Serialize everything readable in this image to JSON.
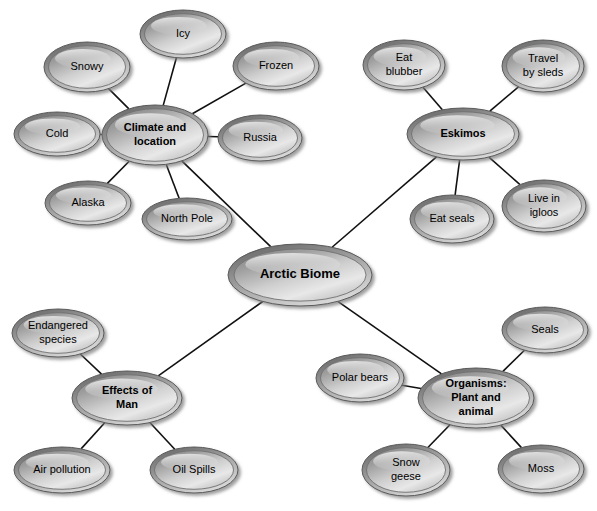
{
  "diagram": {
    "type": "mind-map",
    "background_color": "#ffffff",
    "edge_color": "#111111",
    "node_fill_light": "#e9e9e9",
    "node_fill_mid": "#a9a9a9",
    "node_fill_dark": "#6e6e6e",
    "node_text_color": "#000000"
  },
  "center": {
    "id": "arctic-biome",
    "label": "Arctic Biome",
    "cx": 300,
    "cy": 275,
    "rx": 72,
    "ry": 31,
    "font_size": 13,
    "level": "center"
  },
  "hubs": [
    {
      "id": "climate-and-location",
      "label": "Climate and location",
      "lines": [
        "Climate and",
        "location"
      ],
      "cx": 155,
      "cy": 135,
      "rx": 53,
      "ry": 30,
      "font_size": 11,
      "level": "hub"
    },
    {
      "id": "eskimos",
      "label": "Eskimos",
      "lines": [
        "Eskimos"
      ],
      "cx": 463,
      "cy": 134,
      "rx": 56,
      "ry": 26,
      "font_size": 11,
      "level": "hub"
    },
    {
      "id": "effects-of-man",
      "label": "Effects of Man",
      "lines": [
        "Effects of",
        "Man"
      ],
      "cx": 127,
      "cy": 398,
      "rx": 55,
      "ry": 27,
      "font_size": 11,
      "level": "hub"
    },
    {
      "id": "organisms-plant-and-animal",
      "label": "Organisms: Plant and animal",
      "lines": [
        "Organisms:",
        "Plant and",
        "animal"
      ],
      "cx": 476,
      "cy": 398,
      "rx": 58,
      "ry": 30,
      "font_size": 11,
      "level": "hub"
    }
  ],
  "leaves": [
    {
      "id": "icy",
      "parent": "climate-and-location",
      "label": "Icy",
      "lines": [
        "Icy"
      ],
      "cx": 183,
      "cy": 34,
      "rx": 43,
      "ry": 24,
      "font_size": 11,
      "level": "leaf"
    },
    {
      "id": "snowy",
      "parent": "climate-and-location",
      "label": "Snowy",
      "lines": [
        "Snowy"
      ],
      "cx": 87,
      "cy": 67,
      "rx": 43,
      "ry": 25,
      "font_size": 11,
      "level": "leaf"
    },
    {
      "id": "frozen",
      "parent": "climate-and-location",
      "label": "Frozen",
      "lines": [
        "Frozen"
      ],
      "cx": 276,
      "cy": 66,
      "rx": 43,
      "ry": 24,
      "font_size": 11,
      "level": "leaf"
    },
    {
      "id": "cold",
      "parent": "climate-and-location",
      "label": "Cold",
      "lines": [
        "Cold"
      ],
      "cx": 57,
      "cy": 134,
      "rx": 43,
      "ry": 22,
      "font_size": 11,
      "level": "leaf"
    },
    {
      "id": "russia",
      "parent": "climate-and-location",
      "label": "Russia",
      "lines": [
        "Russia"
      ],
      "cx": 260,
      "cy": 138,
      "rx": 42,
      "ry": 23,
      "font_size": 11,
      "level": "leaf"
    },
    {
      "id": "alaska",
      "parent": "climate-and-location",
      "label": "Alaska",
      "lines": [
        "Alaska"
      ],
      "cx": 88,
      "cy": 203,
      "rx": 43,
      "ry": 22,
      "font_size": 11,
      "level": "leaf"
    },
    {
      "id": "north-pole",
      "parent": "climate-and-location",
      "label": "North Pole",
      "lines": [
        "North Pole"
      ],
      "cx": 187,
      "cy": 219,
      "rx": 45,
      "ry": 21,
      "font_size": 11,
      "level": "leaf"
    },
    {
      "id": "eat-blubber",
      "parent": "eskimos",
      "label": "Eat blubber",
      "lines": [
        "Eat",
        "blubber"
      ],
      "cx": 404,
      "cy": 65,
      "rx": 41,
      "ry": 25,
      "font_size": 11,
      "level": "leaf"
    },
    {
      "id": "travel-by-sleds",
      "parent": "eskimos",
      "label": "Travel by sleds",
      "lines": [
        "Travel",
        "by sleds"
      ],
      "cx": 543,
      "cy": 66,
      "rx": 41,
      "ry": 26,
      "font_size": 11,
      "level": "leaf"
    },
    {
      "id": "eat-seals",
      "parent": "eskimos",
      "label": "Eat seals",
      "lines": [
        "Eat seals"
      ],
      "cx": 452,
      "cy": 219,
      "rx": 42,
      "ry": 24,
      "font_size": 11,
      "level": "leaf"
    },
    {
      "id": "live-in-igloos",
      "parent": "eskimos",
      "label": "Live in igloos",
      "lines": [
        "Live in",
        "igloos"
      ],
      "cx": 544,
      "cy": 206,
      "rx": 42,
      "ry": 26,
      "font_size": 11,
      "level": "leaf"
    },
    {
      "id": "endangered-species",
      "parent": "effects-of-man",
      "label": "Endangered species",
      "lines": [
        "Endangered",
        "species"
      ],
      "cx": 58,
      "cy": 333,
      "rx": 46,
      "ry": 24,
      "font_size": 11,
      "level": "leaf"
    },
    {
      "id": "air-pollution",
      "parent": "effects-of-man",
      "label": "Air pollution",
      "lines": [
        "Air pollution"
      ],
      "cx": 62,
      "cy": 470,
      "rx": 48,
      "ry": 23,
      "font_size": 11,
      "level": "leaf"
    },
    {
      "id": "oil-spills",
      "parent": "effects-of-man",
      "label": "Oil Spills",
      "lines": [
        "Oil Spills"
      ],
      "cx": 194,
      "cy": 470,
      "rx": 44,
      "ry": 23,
      "font_size": 11,
      "level": "leaf"
    },
    {
      "id": "polar-bears",
      "parent": "organisms-plant-and-animal",
      "label": "Polar bears",
      "lines": [
        "Polar bears"
      ],
      "cx": 360,
      "cy": 378,
      "rx": 44,
      "ry": 24,
      "font_size": 11,
      "level": "leaf"
    },
    {
      "id": "seals",
      "parent": "organisms-plant-and-animal",
      "label": "Seals",
      "lines": [
        "Seals"
      ],
      "cx": 545,
      "cy": 330,
      "rx": 43,
      "ry": 23,
      "font_size": 11,
      "level": "leaf"
    },
    {
      "id": "snow-geese",
      "parent": "organisms-plant-and-animal",
      "label": "Snow geese",
      "lines": [
        "Snow",
        "geese"
      ],
      "cx": 406,
      "cy": 470,
      "rx": 44,
      "ry": 26,
      "font_size": 11,
      "level": "leaf"
    },
    {
      "id": "moss",
      "parent": "organisms-plant-and-animal",
      "label": "Moss",
      "lines": [
        "Moss"
      ],
      "cx": 541,
      "cy": 469,
      "rx": 43,
      "ry": 24,
      "font_size": 11,
      "level": "leaf"
    }
  ],
  "edges": [
    {
      "from": "arctic-biome",
      "to": "climate-and-location"
    },
    {
      "from": "arctic-biome",
      "to": "eskimos"
    },
    {
      "from": "arctic-biome",
      "to": "effects-of-man"
    },
    {
      "from": "arctic-biome",
      "to": "organisms-plant-and-animal"
    },
    {
      "from": "climate-and-location",
      "to": "icy"
    },
    {
      "from": "climate-and-location",
      "to": "snowy"
    },
    {
      "from": "climate-and-location",
      "to": "frozen"
    },
    {
      "from": "climate-and-location",
      "to": "cold"
    },
    {
      "from": "climate-and-location",
      "to": "russia"
    },
    {
      "from": "climate-and-location",
      "to": "alaska"
    },
    {
      "from": "climate-and-location",
      "to": "north-pole"
    },
    {
      "from": "eskimos",
      "to": "eat-blubber"
    },
    {
      "from": "eskimos",
      "to": "travel-by-sleds"
    },
    {
      "from": "eskimos",
      "to": "eat-seals"
    },
    {
      "from": "eskimos",
      "to": "live-in-igloos"
    },
    {
      "from": "effects-of-man",
      "to": "endangered-species"
    },
    {
      "from": "effects-of-man",
      "to": "air-pollution"
    },
    {
      "from": "effects-of-man",
      "to": "oil-spills"
    },
    {
      "from": "organisms-plant-and-animal",
      "to": "polar-bears"
    },
    {
      "from": "organisms-plant-and-animal",
      "to": "seals"
    },
    {
      "from": "organisms-plant-and-animal",
      "to": "snow-geese"
    },
    {
      "from": "organisms-plant-and-animal",
      "to": "moss"
    }
  ]
}
